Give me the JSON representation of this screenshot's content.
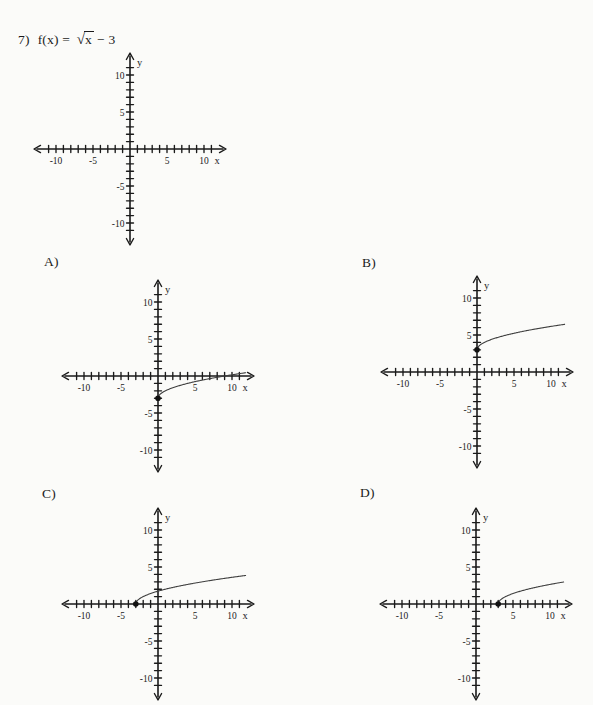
{
  "page": {
    "background": "#fbfbf9",
    "ink": "#1a1a1a",
    "curve_color": "#3f3f3f"
  },
  "question": {
    "number": "7)",
    "prefix": "f(x) =",
    "sqrt_sign": "√",
    "radicand": "x",
    "suffix": "− 3"
  },
  "axes": {
    "x_label": "x",
    "y_label": "y",
    "labeled_ticks": [
      -10,
      -5,
      5,
      10
    ],
    "tick_step": 1,
    "tick_range": [
      -11,
      11
    ]
  },
  "chart_data": [
    {
      "key": "problem-grid",
      "label": "",
      "type": "line",
      "description": "blank coordinate grid for question 7",
      "xlim": [
        -13,
        13
      ],
      "ylim": [
        -13,
        13
      ],
      "x_tick_labels": [
        -10,
        -5,
        5,
        10
      ],
      "y_tick_labels": [
        -10,
        -5,
        5,
        10
      ],
      "curve": null,
      "endpoint_dot": null
    },
    {
      "key": "choice-a",
      "label": "A)",
      "type": "line",
      "equation": "y = √x − 3",
      "curve": {
        "shape": "sqrt",
        "h": 0,
        "k": -3,
        "domain": [
          0,
          11.9
        ]
      },
      "endpoint_dot": [
        0,
        -3
      ],
      "xlim": [
        -13,
        13
      ],
      "ylim": [
        -13,
        13
      ]
    },
    {
      "key": "choice-b",
      "label": "B)",
      "type": "line",
      "equation": "y = √x + 3",
      "curve": {
        "shape": "sqrt",
        "h": 0,
        "k": 3,
        "domain": [
          0,
          11.9
        ]
      },
      "endpoint_dot": [
        0,
        3
      ],
      "xlim": [
        -13,
        13
      ],
      "ylim": [
        -13,
        13
      ]
    },
    {
      "key": "choice-c",
      "label": "C)",
      "type": "line",
      "equation": "y = √(x + 3)",
      "curve": {
        "shape": "sqrt",
        "h": -3,
        "k": 0,
        "domain": [
          -3,
          11.9
        ]
      },
      "endpoint_dot": [
        -3,
        0
      ],
      "xlim": [
        -13,
        13
      ],
      "ylim": [
        -13,
        13
      ]
    },
    {
      "key": "choice-d",
      "label": "D)",
      "type": "line",
      "equation": "y = √(x − 3)",
      "curve": {
        "shape": "sqrt",
        "h": 3,
        "k": 0,
        "domain": [
          3,
          11.9
        ]
      },
      "endpoint_dot": [
        3,
        0
      ],
      "xlim": [
        -13,
        13
      ],
      "ylim": [
        -13,
        13
      ]
    }
  ]
}
